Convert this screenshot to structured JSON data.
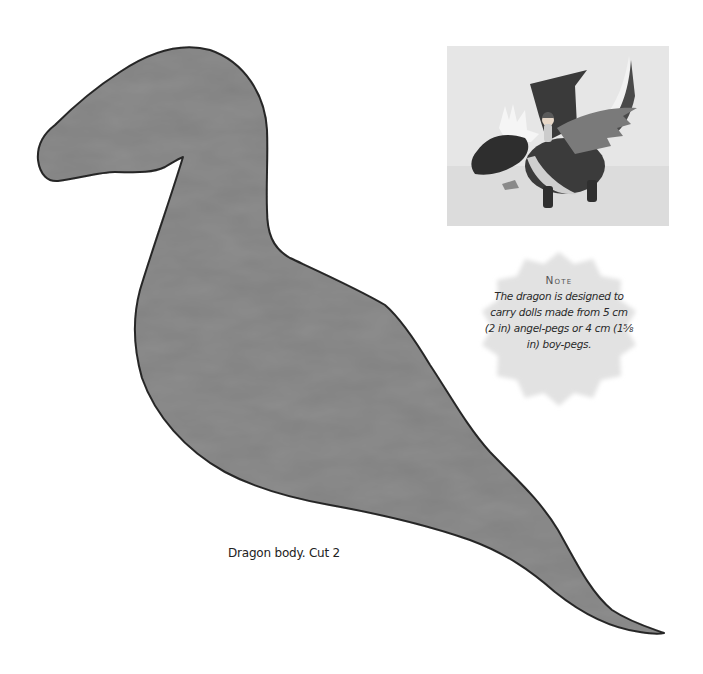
{
  "page": {
    "type": "sewing pattern page"
  },
  "pattern": {
    "piece_name": "dragon-body",
    "fill_color": "#8e8e8e",
    "outline_color": "#2b2b2b",
    "caption": "Dragon body. Cut 2"
  },
  "photo": {
    "description": "Photo of finished felt dragon carrying a peg doll",
    "background_color": "#e4e4e4"
  },
  "note": {
    "title": "Note",
    "body": "The dragon is designed to carry dolls made from 5 cm (2 in) angel-pegs or 4 cm (1⅝ in) boy-pegs.",
    "badge_color": "#e2e2e2"
  }
}
